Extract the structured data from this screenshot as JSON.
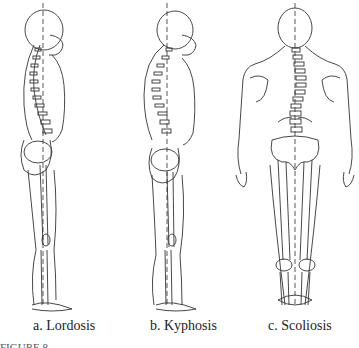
{
  "figure": {
    "panels": [
      {
        "id": "a",
        "label": "a. Lordosis",
        "view": "lateral"
      },
      {
        "id": "b",
        "label": "b. Kyphosis",
        "view": "lateral"
      },
      {
        "id": "c",
        "label": "c. Scoliosis",
        "view": "posterior"
      }
    ],
    "caption_partial": "FIGURE 8-"
  }
}
